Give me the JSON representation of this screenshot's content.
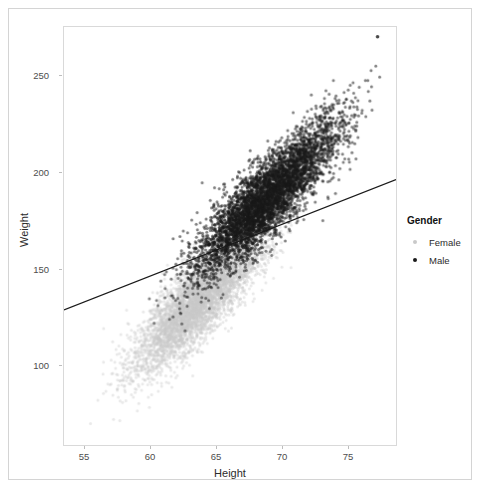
{
  "chart_data": {
    "type": "scatter",
    "title": "",
    "xlabel": "Height",
    "ylabel": "Weight",
    "xlim": [
      52.5,
      79.5
    ],
    "ylim": [
      60,
      275
    ],
    "xticks": [
      55,
      60,
      65,
      70,
      75
    ],
    "yticks": [
      100,
      150,
      200,
      250
    ],
    "xtick_labels": [
      "55",
      "60",
      "65",
      "70",
      "75"
    ],
    "ytick_labels": [
      "100",
      "150",
      "200",
      "250"
    ],
    "grid": false,
    "legend": {
      "title": "Gender",
      "position": "right",
      "entries": [
        {
          "label": "Female",
          "color": "#c9c9c9",
          "marker": "circle"
        },
        {
          "label": "Male",
          "color": "#1a1a1a",
          "marker": "circle"
        }
      ]
    },
    "series": [
      {
        "name": "Female",
        "color": "#c9c9c9",
        "n_points": 5000,
        "x_mean": 63.7,
        "x_sd": 2.7,
        "y_mean": 135.9,
        "y_sd": 19.0,
        "correlation": 0.85,
        "x_range": [
          54.0,
          71.0
        ],
        "y_range": [
          64.0,
          190.0
        ]
      },
      {
        "name": "Male",
        "color": "#1a1a1a",
        "n_points": 5000,
        "x_mean": 69.0,
        "x_sd": 2.9,
        "y_mean": 187.0,
        "y_sd": 19.5,
        "correlation": 0.86,
        "x_range": [
          59.0,
          78.5
        ],
        "y_range": [
          118.0,
          270.0
        ]
      }
    ],
    "fit_line": {
      "name": "overall linear fit",
      "color": "#1a1a1a",
      "x_start": 52.5,
      "y_start": 129.5,
      "x_end": 79.5,
      "y_end": 196.5,
      "slope": 2.48,
      "intercept": -0.7
    },
    "annotations": [
      {
        "label": "outlier",
        "x": 78.0,
        "y": 270.0
      }
    ]
  }
}
